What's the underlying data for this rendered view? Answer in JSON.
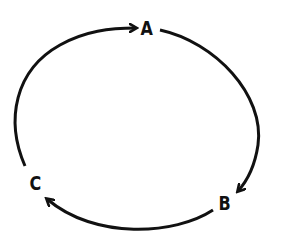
{
  "diagram": {
    "type": "cycle",
    "nodes": [
      {
        "id": "A",
        "label": "A"
      },
      {
        "id": "B",
        "label": "B"
      },
      {
        "id": "C",
        "label": "C"
      }
    ],
    "edges": [
      {
        "from": "A",
        "to": "B"
      },
      {
        "from": "B",
        "to": "C"
      },
      {
        "from": "C",
        "to": "A"
      }
    ],
    "colors": {
      "stroke": "#111111",
      "background": "#ffffff"
    }
  }
}
